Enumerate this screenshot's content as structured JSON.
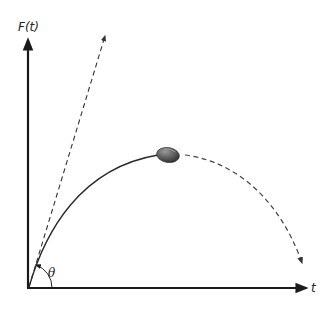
{
  "diagram": {
    "type": "projectile-trajectory",
    "y_axis_label": "F(t)",
    "x_axis_label": "t",
    "angle_label": "θ",
    "elements": {
      "tangent_line": "dashed line at launch angle",
      "trajectory_solid": "solid curve from origin to ball",
      "trajectory_dashed": "dashed continuation descending with arrow",
      "ball": "football-icon"
    },
    "colors": {
      "axis": "#1a1a1a",
      "curve": "#2a2a2a",
      "dashed": "#444444",
      "ball_dark": "#3c3c3c",
      "ball_light": "#8a8a8a"
    }
  }
}
